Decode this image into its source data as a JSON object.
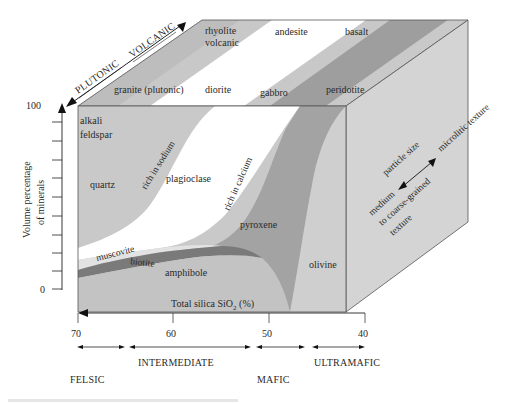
{
  "diagram": {
    "top_direction": {
      "plutonic_label": "PLUTONIC",
      "volcanic_label": "VOLCANIC"
    },
    "top_face_labels": {
      "volcanic_rocks": [
        "rhyolite volcanic",
        "andesite",
        "basalt"
      ],
      "rhyolite_line1": "rhyolite",
      "rhyolite_line2": "volcanic",
      "andesite": "andesite",
      "basalt": "basalt",
      "granite": "granite (plutonic)",
      "diorite": "diorite",
      "gabbro": "gabbro",
      "peridotite": "peridotite"
    },
    "front_face_minerals": {
      "alkali_line1": "alkali",
      "alkali_line2": "feldspar",
      "quartz": "quartz",
      "rich_in_sodium": "rich in sodium",
      "plagioclase": "plagioclase",
      "rich_in_calcium": "rich in calcium",
      "muscovite": "muscovite",
      "biotite": "biotite",
      "amphibole": "amphibole",
      "pyroxene": "pyroxene",
      "olivine": "olivine"
    },
    "side_face": {
      "particle_size": "particle size",
      "microlitic": "microlitic texture",
      "medium": "medium",
      "coarse_grained": "to coarse-grained",
      "texture": "texture"
    },
    "y_axis": {
      "label_line1": "Volume percentage",
      "label_line2": "of minerals",
      "top_tick": "100",
      "bottom_tick": "0"
    },
    "x_axis": {
      "label": "Total silica SiO",
      "label_sub": "2",
      "label_suffix": " (%)",
      "ticks": [
        "70",
        "60",
        "50",
        "40"
      ]
    },
    "categories": {
      "felsic": "FELSIC",
      "intermediate": "INTERMEDIATE",
      "mafic": "MAFIC",
      "ultramafic": "ULTRAMAFIC"
    },
    "colors": {
      "light_gray": "#c9c9c9",
      "mid_gray": "#a9a9a9",
      "dark_gray": "#7a7a7a",
      "white_band": "#ffffff",
      "side_face": "#d6d6d6",
      "very_light": "#e4e4e4"
    }
  }
}
